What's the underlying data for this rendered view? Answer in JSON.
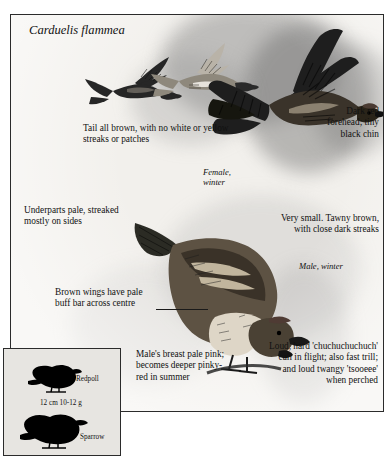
{
  "plate": {
    "scientific_name": "Carduelis flammea",
    "annotations": [
      {
        "id": "tail",
        "text": "Tail all brown, with no white or yellow streaks or patches",
        "align": "left"
      },
      {
        "id": "forehead",
        "text": "Dark red forehead; tiny black chin",
        "align": "right"
      },
      {
        "id": "underparts",
        "text": "Underparts pale, streaked mostly on sides",
        "align": "left"
      },
      {
        "id": "size-colour",
        "text": "Very small. Tawny brown, with close dark streaks",
        "align": "right"
      },
      {
        "id": "wingbar",
        "text": "Brown wings have pale buff bar across centre",
        "align": "left"
      },
      {
        "id": "breast",
        "text": "Male's breast pale pink; becomes deeper pinky-red in summer",
        "align": "left"
      },
      {
        "id": "voice",
        "text": "Loud, hard 'chuchuchuchuch' call in flight; also fast trill; and loud twangy 'tsooeee' when perched",
        "align": "right"
      }
    ],
    "figure_labels": [
      {
        "id": "female",
        "line1": "Female,",
        "line2": "winter"
      },
      {
        "id": "male",
        "line1": "Male, winter",
        "line2": ""
      }
    ]
  },
  "size_box": {
    "species_label": "Redpoll",
    "compare_label": "Sparrow",
    "measurements": "12 cm  10-12 g"
  },
  "colors": {
    "ink": "#111111",
    "frame": "#2b2b2b",
    "plate_bg": "#f2f0ec",
    "box_bg": "#e7e5e1"
  }
}
